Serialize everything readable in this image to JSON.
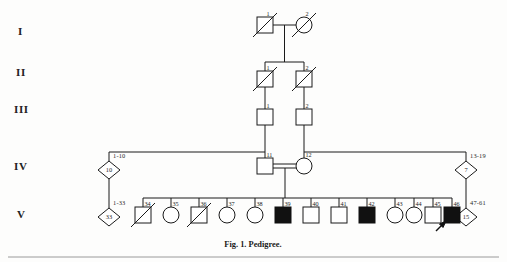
{
  "figure": {
    "caption": "Fig. 1. Pedigree.",
    "background_color": "#fdfdfc",
    "ink_color": "#1a1a1a",
    "affected_fill": "#111111",
    "unaffected_fill": "#ffffff"
  },
  "generation_labels": [
    {
      "name": "generation-label-i",
      "text": "I",
      "x": 18,
      "y": 35
    },
    {
      "name": "generation-label-ii",
      "text": "II",
      "x": 16,
      "y": 76
    },
    {
      "name": "generation-label-iii",
      "text": "III",
      "x": 14,
      "y": 113
    },
    {
      "name": "generation-label-iv",
      "text": "IV",
      "x": 14,
      "y": 170
    },
    {
      "name": "generation-label-v",
      "text": "V",
      "x": 17,
      "y": 218
    }
  ],
  "individuals": [
    {
      "name": "individual-i-1",
      "generation": "I",
      "id": "1",
      "sex": "male",
      "shape": "square",
      "affected": false,
      "deceased": true,
      "proband": false,
      "x": 265,
      "y": 25
    },
    {
      "name": "individual-i-2",
      "generation": "I",
      "id": "2",
      "sex": "female",
      "shape": "circle",
      "affected": false,
      "deceased": true,
      "proband": false,
      "x": 304,
      "y": 25
    },
    {
      "name": "individual-ii-1",
      "generation": "II",
      "id": "1",
      "sex": "male",
      "shape": "square",
      "affected": false,
      "deceased": true,
      "proband": false,
      "x": 265,
      "y": 79
    },
    {
      "name": "individual-ii-2",
      "generation": "II",
      "id": "2",
      "sex": "male",
      "shape": "square",
      "affected": false,
      "deceased": true,
      "proband": false,
      "x": 304,
      "y": 79
    },
    {
      "name": "individual-iii-1",
      "generation": "III",
      "id": "1",
      "sex": "male",
      "shape": "square",
      "affected": false,
      "deceased": false,
      "proband": false,
      "x": 265,
      "y": 117
    },
    {
      "name": "individual-iii-2",
      "generation": "III",
      "id": "2",
      "sex": "male",
      "shape": "square",
      "affected": false,
      "deceased": false,
      "proband": false,
      "x": 304,
      "y": 117
    },
    {
      "name": "individual-iv-11",
      "generation": "IV",
      "id": "11",
      "sex": "male",
      "shape": "square",
      "affected": false,
      "deceased": false,
      "proband": false,
      "x": 265,
      "y": 166
    },
    {
      "name": "individual-iv-12",
      "generation": "IV",
      "id": "12",
      "sex": "female",
      "shape": "circle",
      "affected": false,
      "deceased": false,
      "proband": false,
      "x": 304,
      "y": 166
    },
    {
      "name": "individual-v-34",
      "generation": "V",
      "id": "34",
      "sex": "male",
      "shape": "square",
      "affected": false,
      "deceased": true,
      "proband": false,
      "x": 143,
      "y": 215
    },
    {
      "name": "individual-v-35",
      "generation": "V",
      "id": "35",
      "sex": "female",
      "shape": "circle",
      "affected": false,
      "deceased": false,
      "proband": false,
      "x": 171,
      "y": 215
    },
    {
      "name": "individual-v-36",
      "generation": "V",
      "id": "36",
      "sex": "male",
      "shape": "square",
      "affected": false,
      "deceased": true,
      "proband": false,
      "x": 199,
      "y": 215
    },
    {
      "name": "individual-v-37",
      "generation": "V",
      "id": "37",
      "sex": "female",
      "shape": "circle",
      "affected": false,
      "deceased": false,
      "proband": false,
      "x": 227,
      "y": 215
    },
    {
      "name": "individual-v-38",
      "generation": "V",
      "id": "38",
      "sex": "female",
      "shape": "circle",
      "affected": false,
      "deceased": false,
      "proband": false,
      "x": 255,
      "y": 215
    },
    {
      "name": "individual-v-39",
      "generation": "V",
      "id": "39",
      "sex": "male",
      "shape": "square",
      "affected": true,
      "deceased": false,
      "proband": false,
      "x": 283,
      "y": 215
    },
    {
      "name": "individual-v-40",
      "generation": "V",
      "id": "40",
      "sex": "male",
      "shape": "square",
      "affected": false,
      "deceased": false,
      "proband": false,
      "x": 311,
      "y": 215
    },
    {
      "name": "individual-v-41",
      "generation": "V",
      "id": "41",
      "sex": "male",
      "shape": "square",
      "affected": false,
      "deceased": false,
      "proband": false,
      "x": 339,
      "y": 215
    },
    {
      "name": "individual-v-42",
      "generation": "V",
      "id": "42",
      "sex": "male",
      "shape": "square",
      "affected": true,
      "deceased": false,
      "proband": false,
      "x": 367,
      "y": 215
    },
    {
      "name": "individual-v-43",
      "generation": "V",
      "id": "43",
      "sex": "female",
      "shape": "circle",
      "affected": false,
      "deceased": false,
      "proband": false,
      "x": 395,
      "y": 215
    },
    {
      "name": "individual-v-44",
      "generation": "V",
      "id": "44",
      "sex": "female",
      "shape": "circle",
      "affected": false,
      "deceased": false,
      "proband": false,
      "x": 414,
      "y": 215
    },
    {
      "name": "individual-v-45",
      "generation": "V",
      "id": "45",
      "sex": "male",
      "shape": "square",
      "affected": false,
      "deceased": false,
      "proband": false,
      "x": 433,
      "y": 215
    },
    {
      "name": "individual-v-46",
      "generation": "V",
      "id": "46",
      "sex": "male",
      "shape": "square",
      "affected": true,
      "deceased": false,
      "proband": true,
      "x": 452,
      "y": 215
    }
  ],
  "sibship_groups": [
    {
      "name": "sibship-group-iv-left",
      "count": "10",
      "range": "1-10",
      "x": 109,
      "y": 170
    },
    {
      "name": "sibship-group-iv-right",
      "count": "7",
      "range": "13-19",
      "x": 466,
      "y": 170
    },
    {
      "name": "sibship-group-v-left",
      "count": "33",
      "range": "1-33",
      "x": 109,
      "y": 217
    },
    {
      "name": "sibship-group-v-right",
      "count": "15",
      "range": "47-61",
      "x": 466,
      "y": 217
    }
  ],
  "matings": [
    {
      "name": "mating-i-1-x-i-2",
      "consanguineous": false
    },
    {
      "name": "mating-iv-11-x-iv-12",
      "consanguineous": true
    }
  ]
}
